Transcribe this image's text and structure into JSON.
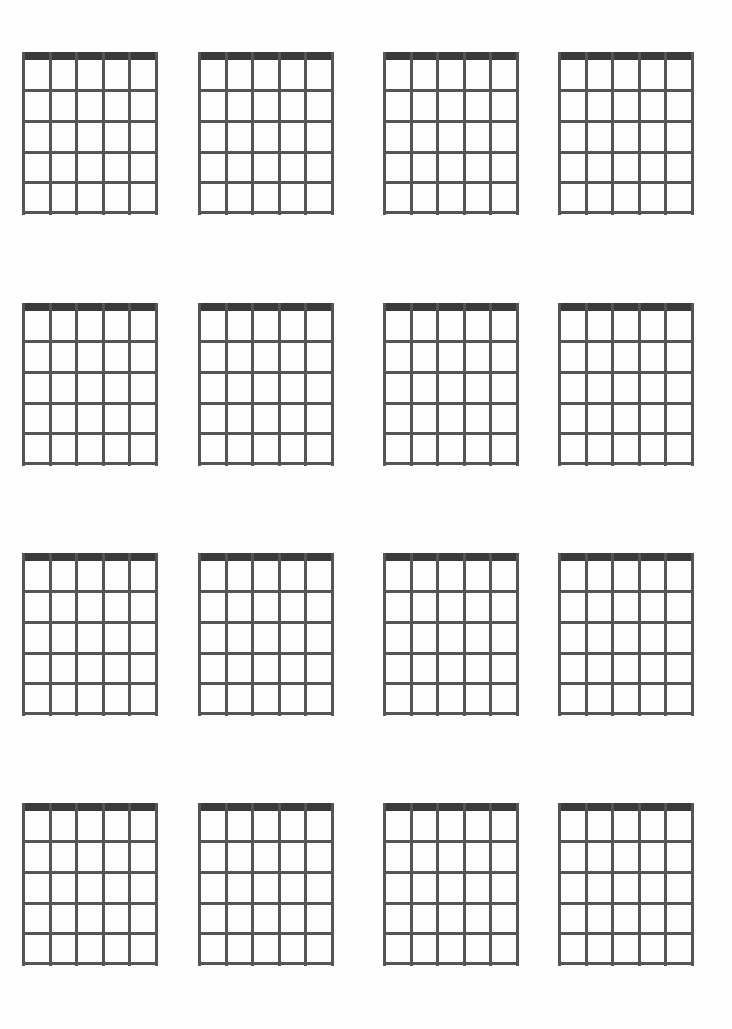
{
  "page": {
    "background_color": "#fdfdfd",
    "width": 732,
    "height": 1029
  },
  "style": {
    "nut_color": "#3a3a3a",
    "grid_line_color": "#555555",
    "nut_thickness": 8,
    "grid_line_thickness": 3
  },
  "chart_data": {
    "type": "diagram",
    "diagram_kind": "guitar-chord-chart-blank",
    "grid_rows": 4,
    "grid_columns": 4,
    "total_diagrams": 16,
    "per_diagram": {
      "strings": 6,
      "string_columns": 5,
      "frets": 5,
      "fret_rows": 5,
      "has_nut": true,
      "markers": [],
      "labels": [],
      "fingerings": []
    },
    "diagram_width": 136,
    "diagram_height": 163,
    "column_x": [
      22,
      198,
      383,
      558
    ],
    "row_y": [
      52,
      303,
      553,
      803
    ]
  },
  "diagrams": [
    {
      "id": "chord-diagram-1",
      "row": 1,
      "col": 1,
      "label": ""
    },
    {
      "id": "chord-diagram-2",
      "row": 1,
      "col": 2,
      "label": ""
    },
    {
      "id": "chord-diagram-3",
      "row": 1,
      "col": 3,
      "label": ""
    },
    {
      "id": "chord-diagram-4",
      "row": 1,
      "col": 4,
      "label": ""
    },
    {
      "id": "chord-diagram-5",
      "row": 2,
      "col": 1,
      "label": ""
    },
    {
      "id": "chord-diagram-6",
      "row": 2,
      "col": 2,
      "label": ""
    },
    {
      "id": "chord-diagram-7",
      "row": 2,
      "col": 3,
      "label": ""
    },
    {
      "id": "chord-diagram-8",
      "row": 2,
      "col": 4,
      "label": ""
    },
    {
      "id": "chord-diagram-9",
      "row": 3,
      "col": 1,
      "label": ""
    },
    {
      "id": "chord-diagram-10",
      "row": 3,
      "col": 2,
      "label": ""
    },
    {
      "id": "chord-diagram-11",
      "row": 3,
      "col": 3,
      "label": ""
    },
    {
      "id": "chord-diagram-12",
      "row": 3,
      "col": 4,
      "label": ""
    },
    {
      "id": "chord-diagram-13",
      "row": 4,
      "col": 1,
      "label": ""
    },
    {
      "id": "chord-diagram-14",
      "row": 4,
      "col": 2,
      "label": ""
    },
    {
      "id": "chord-diagram-15",
      "row": 4,
      "col": 3,
      "label": ""
    },
    {
      "id": "chord-diagram-16",
      "row": 4,
      "col": 4,
      "label": ""
    }
  ]
}
